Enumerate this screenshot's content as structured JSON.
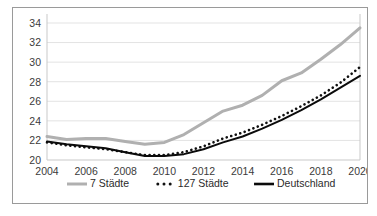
{
  "chart_data": {
    "type": "line",
    "title": "",
    "xlabel": "",
    "ylabel": "",
    "x": [
      2004,
      2005,
      2006,
      2007,
      2008,
      2009,
      2010,
      2011,
      2012,
      2013,
      2014,
      2015,
      2016,
      2017,
      2018,
      2019,
      2020
    ],
    "xlim": [
      2004,
      2020
    ],
    "ylim": [
      20,
      34
    ],
    "yticks": [
      20,
      22,
      24,
      26,
      28,
      30,
      32,
      34
    ],
    "xticks": [
      2004,
      2006,
      2008,
      2010,
      2012,
      2014,
      2016,
      2018,
      2020
    ],
    "grid": "horizontal",
    "legend_position": "bottom",
    "series": [
      {
        "name": "7 Städte",
        "style": "solid",
        "color": "#b0b0b0",
        "values": [
          22.4,
          22.1,
          22.2,
          22.2,
          21.9,
          21.6,
          21.8,
          22.6,
          23.8,
          25.0,
          25.6,
          26.6,
          28.1,
          28.9,
          30.3,
          31.8,
          33.5
        ]
      },
      {
        "name": "127 Städte",
        "style": "dotted",
        "color": "#111111",
        "values": [
          21.8,
          21.5,
          21.3,
          21.1,
          20.8,
          20.5,
          20.5,
          20.8,
          21.4,
          22.2,
          22.8,
          23.6,
          24.5,
          25.5,
          26.6,
          27.9,
          29.5
        ]
      },
      {
        "name": "Deutschland",
        "style": "solid",
        "color": "#0b0b0b",
        "values": [
          21.9,
          21.6,
          21.4,
          21.2,
          20.8,
          20.4,
          20.4,
          20.6,
          21.1,
          21.8,
          22.4,
          23.2,
          24.1,
          25.1,
          26.2,
          27.4,
          28.6
        ]
      }
    ],
    "yticklabels": [
      "20",
      "22",
      "24",
      "26",
      "28",
      "30",
      "32",
      "34"
    ],
    "xticklabels": [
      "2004",
      "2006",
      "2008",
      "2010",
      "2012",
      "2014",
      "2016",
      "2018",
      "2020"
    ],
    "legend": [
      {
        "label": "7 Städte",
        "marker": "line",
        "color": "#b0b0b0"
      },
      {
        "label": "127 Städte",
        "marker": "dots",
        "color": "#111111"
      },
      {
        "label": "Deutschland",
        "marker": "line",
        "color": "#0b0b0b"
      }
    ],
    "colors": {
      "grid": "#e3e3e3",
      "axis": "#c9c9c9",
      "frame": "#9a9a9a",
      "text": "#3b3b3b"
    }
  }
}
